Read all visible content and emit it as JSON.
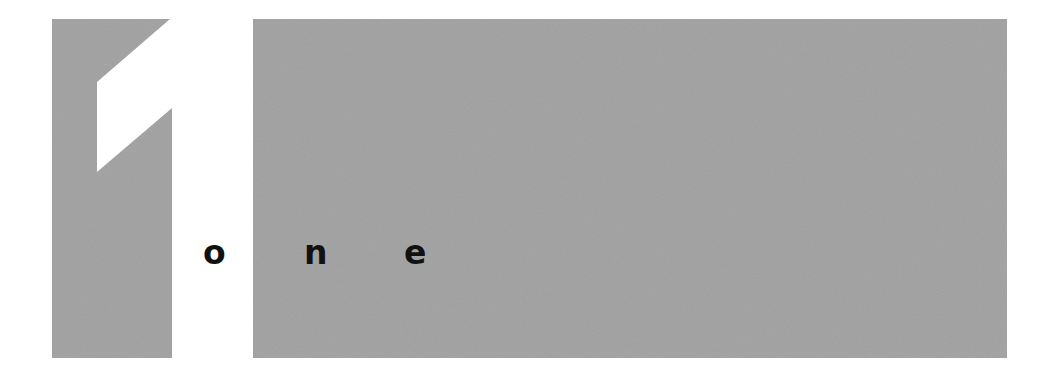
{
  "logo": {
    "numeral": "1",
    "word": "one",
    "letters": [
      "o",
      "n",
      "e"
    ],
    "colors": {
      "block": "#a7a7a7",
      "background": "#ffffff",
      "text": "#111111"
    }
  }
}
